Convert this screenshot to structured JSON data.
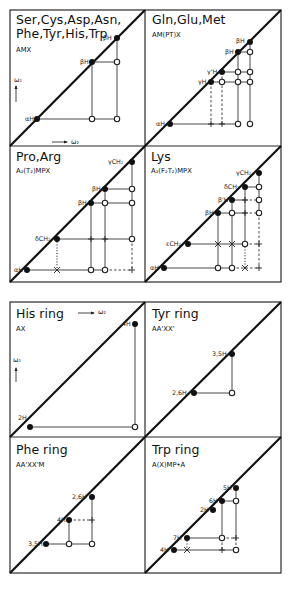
{
  "figure": {
    "panels": [
      {
        "id": "ser-cys",
        "title_line1": "Ser,Cys,Asp,Asn,",
        "title_line2": "Phe,Tyr,His,Trp",
        "spin_system": "AMX",
        "diag_peaks": [
          "αH",
          "βH",
          "βH"
        ]
      },
      {
        "id": "gln-glu-met",
        "title_line1": "Gln,Glu,Met",
        "spin_system": "AM(PT)X",
        "diag_peaks": [
          "αH",
          "γH",
          "γH",
          "βH",
          "βH"
        ]
      },
      {
        "id": "pro-arg",
        "title_line1": "Pro,Arg",
        "spin_system": "A₂(T₂)MPX",
        "diag_peaks": [
          "αH",
          "δCH₂",
          "βH",
          "βH",
          "γCH₂"
        ]
      },
      {
        "id": "lys",
        "title_line1": "Lys",
        "spin_system": "A₂(F₂T₂)MPX",
        "diag_peaks": [
          "αH",
          "εCH₂",
          "βH",
          "β'H",
          "δCH₂",
          "γCH₂"
        ]
      },
      {
        "id": "his-ring",
        "title_line1": "His  ring",
        "spin_system": "AX",
        "diag_peaks": [
          "2H",
          "4H"
        ]
      },
      {
        "id": "tyr-ring",
        "title_line1": "Tyr  ring",
        "spin_system": "AA'XX'",
        "diag_peaks": [
          "2,6H",
          "3,5H"
        ]
      },
      {
        "id": "phe-ring",
        "title_line1": "Phe  ring",
        "spin_system": "AA'XX'M",
        "diag_peaks": [
          "3,5H",
          "4H",
          "2,6H"
        ]
      },
      {
        "id": "trp-ring",
        "title_line1": "Trp  ring",
        "spin_system": "A(X)MP•A",
        "diag_peaks": [
          "4H",
          "7H",
          "2H",
          "6H",
          "5H"
        ]
      }
    ],
    "axes": {
      "omega1": "ω₁",
      "omega2": "ω₂"
    },
    "labels": {
      "p1": {
        "aH": "αH",
        "b1": "βH",
        "b2": "βH"
      },
      "p2": {
        "aH": "αH",
        "g1": "γH",
        "g2": "γ'H",
        "b1": "βH",
        "b2": "βH"
      },
      "p3": {
        "aH": "αH",
        "d": "δCH₂",
        "b1": "βH",
        "b2": "βH",
        "g": "γCH₂"
      },
      "p4": {
        "aH": "αH",
        "e": "εCH₂",
        "b1": "βH",
        "b2": "β'H",
        "d": "δCH₂",
        "g": "γCH₂"
      },
      "p5": {
        "h2": "2H",
        "h4": "4H"
      },
      "p6": {
        "h26": "2,6H",
        "h35": "3,5H"
      },
      "p7": {
        "h35": "3,5H",
        "h4": "4H",
        "h26": "2,6H"
      },
      "p8": {
        "h4": "4H",
        "h7": "7H",
        "h2": "2H",
        "h6": "6H",
        "h5": "5H"
      }
    }
  }
}
